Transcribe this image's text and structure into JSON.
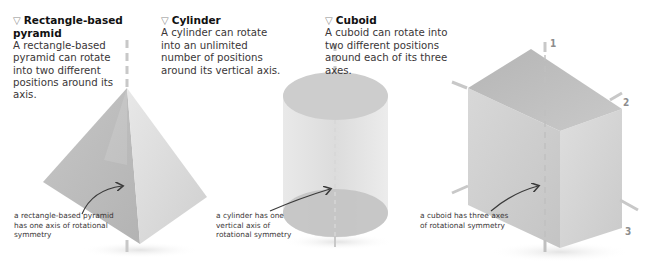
{
  "panels": [
    {
      "heading_marker": "▽",
      "title": "Rectangle-based pyramid",
      "description": "A rectangle-based pyramid can rotate into two different positions around its axis.",
      "callout": "a rectangle-based pyramid has one axis of rotational symmetry"
    },
    {
      "heading_marker": "▽",
      "title": "Cylinder",
      "description": "A cylinder can rotate into an unlimited number of positions around its vertical axis.",
      "callout": "a cylinder has one vertical axis of rotational symmetry"
    },
    {
      "heading_marker": "▽",
      "title": "Cuboid",
      "description": "A cuboid can rotate into two different positions around each of its three axes.",
      "callout": "a cuboid has three axes of rotational symmetry"
    }
  ],
  "cuboid_axes": [
    "1",
    "2",
    "3"
  ],
  "colors": {
    "shape_dark": "#b9b9b9",
    "shape_mid": "#cfcfcf",
    "shape_light": "#e4e4e4",
    "axis_line": "#c8c8c8",
    "arrow": "#3a3a3a",
    "heading_marker": "#8a8a8a"
  }
}
